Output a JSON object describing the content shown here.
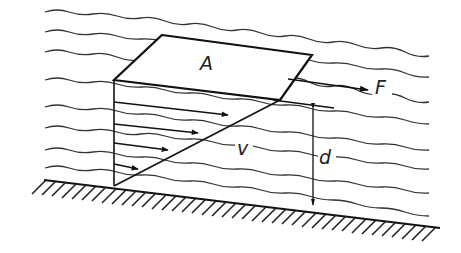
{
  "figure": {
    "labels": {
      "area": "A",
      "force": "F",
      "velocity": "v",
      "depth": "d"
    },
    "colors": {
      "ink": "#111111",
      "background": "#ffffff"
    },
    "waves": [
      {
        "y0": 12,
        "y1": 55
      },
      {
        "y0": 32,
        "y1": 80
      },
      {
        "y0": 52,
        "y1": 105
      },
      {
        "y0": 80,
        "y1": 127
      },
      {
        "y0": 107,
        "y1": 152
      },
      {
        "y0": 128,
        "y1": 168
      },
      {
        "y0": 150,
        "y1": 195
      },
      {
        "y0": 168,
        "y1": 215
      }
    ],
    "velocity_arrows": [
      {
        "x1": 114,
        "y1": 102,
        "x2": 228,
        "y2": 115
      },
      {
        "x1": 114,
        "y1": 124,
        "x2": 198,
        "y2": 133
      },
      {
        "x1": 114,
        "y1": 143,
        "x2": 168,
        "y2": 150
      },
      {
        "x1": 114,
        "y1": 165,
        "x2": 138,
        "y2": 170
      }
    ]
  }
}
